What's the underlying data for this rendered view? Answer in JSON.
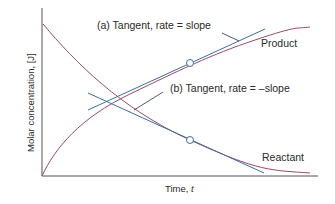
{
  "figure": {
    "type": "concentration-time diagram",
    "axes": {
      "xlabel": "Time, ",
      "xlabel_var": "t",
      "ylabel": "Molar concentration, [J]"
    },
    "curves": [
      {
        "name": "Product",
        "label": "Product",
        "color": "#9b4a6a"
      },
      {
        "name": "Reactant",
        "label": "Reactant",
        "color": "#9b4a6a"
      }
    ],
    "tangents": [
      {
        "id": "a",
        "label": "(a) Tangent, rate = slope",
        "color": "#3d6e9e"
      },
      {
        "id": "b",
        "label": "(b) Tangent, rate = –slope",
        "color": "#3d6e9e"
      }
    ],
    "colors": {
      "axis": "#555555",
      "curve": "#9b4a6a",
      "tangent": "#3d6e9e",
      "leader": "#3a4a5a",
      "text": "#2a2a2a"
    }
  }
}
